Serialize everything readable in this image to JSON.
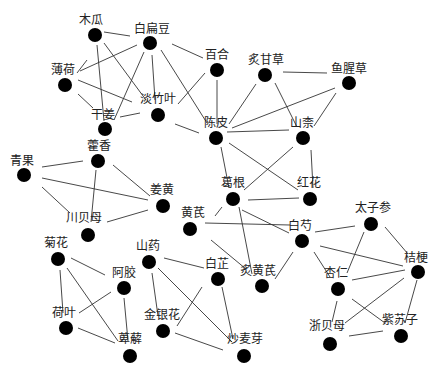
{
  "diagram": {
    "type": "network-graph",
    "node_color": "#000000",
    "edge_color": "#333333",
    "nodes": [
      {
        "id": "mugua",
        "label": "木瓜",
        "x": 95,
        "y": 35,
        "lx": 91,
        "ly": 24
      },
      {
        "id": "baibiandou",
        "label": "白扁豆",
        "x": 150,
        "y": 43,
        "lx": 152,
        "ly": 33
      },
      {
        "id": "baihe",
        "label": "百合",
        "x": 217,
        "y": 70,
        "lx": 217,
        "ly": 59
      },
      {
        "id": "bohe",
        "label": "薄荷",
        "x": 65,
        "y": 85,
        "lx": 63,
        "ly": 74
      },
      {
        "id": "danzhuye",
        "label": "淡竹叶",
        "x": 158,
        "y": 115,
        "lx": 158,
        "ly": 103
      },
      {
        "id": "ganjiang",
        "label": "干姜",
        "x": 105,
        "y": 129,
        "lx": 103,
        "ly": 119
      },
      {
        "id": "zhigancao",
        "label": "炙甘草",
        "x": 265,
        "y": 75,
        "lx": 266,
        "ly": 64
      },
      {
        "id": "yuxingcao",
        "label": "鱼腥草",
        "x": 349,
        "y": 83,
        "lx": 349,
        "ly": 73
      },
      {
        "id": "chenpi",
        "label": "陈皮",
        "x": 216,
        "y": 138,
        "lx": 216,
        "ly": 127
      },
      {
        "id": "shannai",
        "label": "山柰",
        "x": 303,
        "y": 138,
        "lx": 302,
        "ly": 127
      },
      {
        "id": "huoxiang",
        "label": "藿香",
        "x": 98,
        "y": 161,
        "lx": 99,
        "ly": 150
      },
      {
        "id": "qingguo",
        "label": "青果",
        "x": 24,
        "y": 175,
        "lx": 22,
        "ly": 165
      },
      {
        "id": "jianghuang",
        "label": "姜黄",
        "x": 163,
        "y": 206,
        "lx": 162,
        "ly": 194
      },
      {
        "id": "chuanbeimu",
        "label": "川贝母",
        "x": 88,
        "y": 235,
        "lx": 84,
        "ly": 222
      },
      {
        "id": "gegen",
        "label": "葛根",
        "x": 233,
        "y": 199,
        "lx": 233,
        "ly": 187
      },
      {
        "id": "honghua",
        "label": "红花",
        "x": 310,
        "y": 199,
        "lx": 309,
        "ly": 187
      },
      {
        "id": "huangqi",
        "label": "黄芪",
        "x": 190,
        "y": 229,
        "lx": 193,
        "ly": 217
      },
      {
        "id": "baishao",
        "label": "白芍",
        "x": 302,
        "y": 241,
        "lx": 300,
        "ly": 230
      },
      {
        "id": "taizishen",
        "label": "太子参",
        "x": 371,
        "y": 224,
        "lx": 373,
        "ly": 212
      },
      {
        "id": "zhihuangqi",
        "label": "炙黄芪",
        "x": 262,
        "y": 286,
        "lx": 258,
        "ly": 275
      },
      {
        "id": "baizhi",
        "label": "白芷",
        "x": 218,
        "y": 279,
        "lx": 217,
        "ly": 268
      },
      {
        "id": "jiegeng",
        "label": "桔梗",
        "x": 418,
        "y": 272,
        "lx": 416,
        "ly": 262
      },
      {
        "id": "xingren",
        "label": "杏仁",
        "x": 338,
        "y": 289,
        "lx": 336,
        "ly": 277
      },
      {
        "id": "juhua",
        "label": "菊花",
        "x": 58,
        "y": 259,
        "lx": 56,
        "ly": 247
      },
      {
        "id": "shanyao",
        "label": "山药",
        "x": 149,
        "y": 262,
        "lx": 148,
        "ly": 250
      },
      {
        "id": "ejiao",
        "label": "阿胶",
        "x": 124,
        "y": 288,
        "lx": 124,
        "ly": 277
      },
      {
        "id": "heye",
        "label": "荷叶",
        "x": 66,
        "y": 328,
        "lx": 64,
        "ly": 317
      },
      {
        "id": "jinyinhua",
        "label": "金银花",
        "x": 163,
        "y": 331,
        "lx": 162,
        "ly": 319
      },
      {
        "id": "bixie",
        "label": "萆薢",
        "x": 130,
        "y": 356,
        "lx": 130,
        "ly": 343
      },
      {
        "id": "chaomaiya",
        "label": "炒麦芽",
        "x": 244,
        "y": 356,
        "lx": 245,
        "ly": 343
      },
      {
        "id": "zhebeimu",
        "label": "浙贝母",
        "x": 330,
        "y": 344,
        "lx": 327,
        "ly": 330
      },
      {
        "id": "zisuzi",
        "label": "紫苏子",
        "x": 401,
        "y": 336,
        "lx": 400,
        "ly": 324
      }
    ],
    "edges": [
      [
        104,
        32,
        130,
        36
      ],
      [
        77,
        73,
        87,
        60
      ],
      [
        80,
        71,
        137,
        45
      ],
      [
        97,
        45,
        104,
        121
      ],
      [
        104,
        43,
        146,
        100
      ],
      [
        78,
        80,
        132,
        102
      ],
      [
        78,
        94,
        93,
        108
      ],
      [
        144,
        52,
        114,
        120
      ],
      [
        152,
        55,
        155,
        100
      ],
      [
        161,
        50,
        207,
        123
      ],
      [
        172,
        44,
        203,
        58
      ],
      [
        120,
        117,
        140,
        113
      ],
      [
        175,
        124,
        199,
        133
      ],
      [
        178,
        104,
        205,
        73
      ],
      [
        217,
        80,
        217,
        124
      ],
      [
        229,
        124,
        256,
        84
      ],
      [
        232,
        128,
        335,
        88
      ],
      [
        227,
        132,
        289,
        130
      ],
      [
        275,
        83,
        297,
        127
      ],
      [
        283,
        72,
        327,
        73
      ],
      [
        314,
        126,
        336,
        93
      ],
      [
        221,
        147,
        229,
        188
      ],
      [
        229,
        143,
        298,
        190
      ],
      [
        244,
        190,
        293,
        147
      ],
      [
        311,
        150,
        313,
        188
      ],
      [
        248,
        200,
        299,
        198
      ],
      [
        42,
        167,
        83,
        161
      ],
      [
        42,
        178,
        148,
        200
      ],
      [
        42,
        187,
        70,
        213
      ],
      [
        96,
        170,
        91,
        222
      ],
      [
        113,
        165,
        150,
        196
      ],
      [
        107,
        222,
        148,
        210
      ],
      [
        222,
        207,
        215,
        216
      ],
      [
        205,
        223,
        290,
        225
      ],
      [
        242,
        210,
        289,
        233
      ],
      [
        239,
        207,
        252,
        274
      ],
      [
        211,
        240,
        246,
        269
      ],
      [
        275,
        279,
        293,
        252
      ],
      [
        315,
        232,
        355,
        226
      ],
      [
        320,
        246,
        403,
        266
      ],
      [
        314,
        252,
        330,
        277
      ],
      [
        364,
        232,
        347,
        273
      ],
      [
        385,
        227,
        408,
        254
      ],
      [
        352,
        280,
        405,
        270
      ],
      [
        417,
        280,
        405,
        323
      ],
      [
        404,
        278,
        345,
        323
      ],
      [
        352,
        299,
        385,
        323
      ],
      [
        337,
        301,
        332,
        322
      ],
      [
        349,
        336,
        383,
        331
      ],
      [
        71,
        258,
        105,
        275
      ],
      [
        60,
        270,
        63,
        313
      ],
      [
        67,
        268,
        118,
        341
      ],
      [
        79,
        313,
        111,
        292
      ],
      [
        124,
        298,
        128,
        341
      ],
      [
        78,
        328,
        115,
        343
      ],
      [
        164,
        258,
        204,
        268
      ],
      [
        152,
        273,
        158,
        316
      ],
      [
        158,
        268,
        232,
        342
      ],
      [
        177,
        326,
        202,
        287
      ],
      [
        222,
        287,
        233,
        339
      ],
      [
        175,
        333,
        223,
        350
      ]
    ]
  }
}
